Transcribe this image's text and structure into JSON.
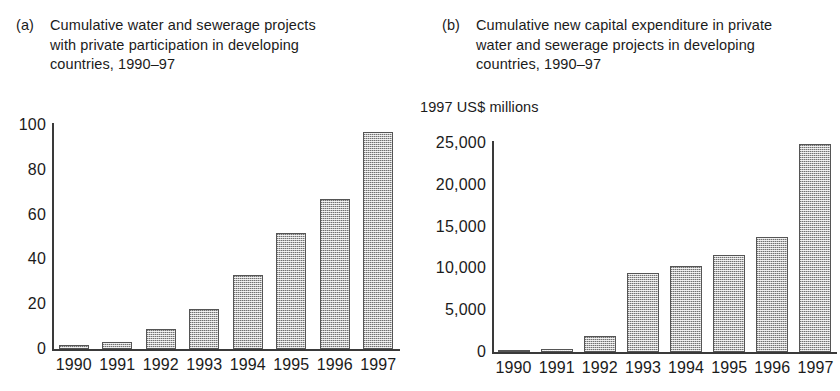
{
  "figure": {
    "panel_a": {
      "tag": "(a)",
      "caption": "Cumulative water and sewerage projects with private participation in developing countries, 1990–97"
    },
    "panel_b": {
      "tag": "(b)",
      "caption": "Cumulative new capital expenditure in private water and sewerage projects in developing countries, 1990–97",
      "unit_label": "1997 US$ millions"
    }
  },
  "chart_data": [
    {
      "type": "bar",
      "panel": "(a)",
      "title": "Cumulative water and sewerage projects with private participation in developing countries, 1990–97",
      "xlabel": "",
      "ylabel": "",
      "categories": [
        "1990",
        "1991",
        "1992",
        "1993",
        "1994",
        "1995",
        "1996",
        "1997"
      ],
      "values": [
        2,
        3,
        9,
        18,
        33,
        52,
        67,
        97
      ],
      "ytick_labels": [
        "0",
        "20",
        "40",
        "60",
        "80",
        "100"
      ],
      "ytick_values": [
        0,
        20,
        40,
        60,
        80,
        100
      ],
      "ylim": [
        0,
        100
      ],
      "grid": false,
      "legend": "none"
    },
    {
      "type": "bar",
      "panel": "(b)",
      "title": "Cumulative new capital expenditure in private water and sewerage projects in developing countries, 1990–97",
      "xlabel": "",
      "ylabel": "1997 US$ millions",
      "categories": [
        "1990",
        "1991",
        "1992",
        "1993",
        "1994",
        "1995",
        "1996",
        "1997"
      ],
      "values": [
        150,
        350,
        1900,
        9400,
        10300,
        11600,
        13700,
        24900
      ],
      "ytick_labels": [
        "0",
        "5,000",
        "10,000",
        "15,000",
        "20,000",
        "25,000"
      ],
      "ytick_values": [
        0,
        5000,
        10000,
        15000,
        20000,
        25000
      ],
      "ylim": [
        0,
        25000
      ],
      "grid": false,
      "legend": "none"
    }
  ]
}
